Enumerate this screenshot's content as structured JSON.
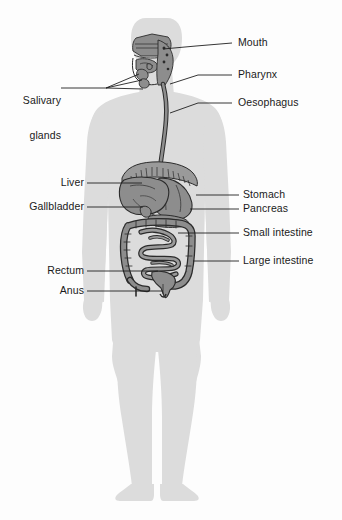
{
  "diagram": {
    "view": "anterior-whole-body",
    "background_color": "#fdfdfd",
    "body_silhouette_color": "#dcdcdc",
    "organ_fill_color": "#8d8d8d",
    "organ_outline_color": "#2b2b2b",
    "leader_line_color": "#1f1f1f",
    "text_color": "#1a1a1a"
  },
  "labels": [
    {
      "id": "mouth",
      "text": "Mouth",
      "side": "right",
      "x": 238,
      "y": 37,
      "leader": [
        [
          232,
          43
        ],
        [
          196,
          46
        ],
        [
          163,
          49
        ]
      ]
    },
    {
      "id": "pharynx",
      "text": "Pharynx",
      "side": "right",
      "x": 238,
      "y": 69,
      "leader": [
        [
          232,
          75
        ],
        [
          198,
          75
        ],
        [
          170,
          84
        ]
      ]
    },
    {
      "id": "oesophagus",
      "text": "Oesophagus",
      "side": "right",
      "x": 238,
      "y": 97,
      "leader": [
        [
          232,
          103
        ],
        [
          198,
          103
        ],
        [
          170,
          113
        ]
      ]
    },
    {
      "id": "salivary-glands",
      "text": "Salivary\nglands",
      "line1": "Salivary",
      "line2": "glands",
      "side": "left",
      "x": 31,
      "y": 72,
      "leader_fan": [
        [
          [
            106,
            88
          ],
          [
            139,
            74
          ]
        ],
        [
          [
            106,
            88
          ],
          [
            142,
            80
          ]
        ],
        [
          [
            106,
            88
          ],
          [
            143,
            89
          ]
        ]
      ],
      "leader_stem": [
        [
          61,
          88
        ],
        [
          106,
          88
        ]
      ]
    },
    {
      "id": "liver",
      "text": "Liver",
      "side": "left",
      "x": 53,
      "y": 177,
      "leader": [
        [
          87,
          183
        ],
        [
          142,
          183
        ]
      ]
    },
    {
      "id": "gallbladder",
      "text": "Gallbladder",
      "side": "left",
      "x": 10,
      "y": 201,
      "leader": [
        [
          87,
          207
        ],
        [
          143,
          207
        ]
      ]
    },
    {
      "id": "stomach",
      "text": "Stomach",
      "side": "right",
      "x": 243,
      "y": 189,
      "leader": [
        [
          239,
          195
        ],
        [
          196,
          195
        ]
      ]
    },
    {
      "id": "pancreas",
      "text": "Pancreas",
      "side": "right",
      "x": 243,
      "y": 203,
      "leader": [
        [
          239,
          209
        ],
        [
          190,
          209
        ]
      ]
    },
    {
      "id": "small-intestine",
      "text": "Small intestine",
      "side": "right",
      "x": 243,
      "y": 227,
      "leader": [
        [
          239,
          233
        ],
        [
          178,
          233
        ]
      ]
    },
    {
      "id": "large-intestine",
      "text": "Large intestine",
      "side": "right",
      "x": 243,
      "y": 255,
      "leader": [
        [
          239,
          261
        ],
        [
          193,
          261
        ]
      ]
    },
    {
      "id": "rectum",
      "text": "Rectum",
      "side": "left",
      "x": 37,
      "y": 265,
      "leader": [
        [
          87,
          271
        ],
        [
          158,
          271
        ]
      ]
    },
    {
      "id": "anus",
      "text": "Anus",
      "side": "left",
      "x": 52,
      "y": 285,
      "leader": [
        [
          87,
          291
        ],
        [
          163,
          291
        ]
      ]
    }
  ],
  "organs": [
    {
      "id": "nasal-cavity",
      "name": "Nasal cavity"
    },
    {
      "id": "tongue",
      "name": "Tongue"
    },
    {
      "id": "parotid-gland",
      "name": "Parotid salivary gland"
    },
    {
      "id": "submandibular-gland",
      "name": "Submandibular salivary gland"
    },
    {
      "id": "sublingual-gland",
      "name": "Sublingual salivary gland"
    },
    {
      "id": "pharynx",
      "name": "Pharynx"
    },
    {
      "id": "oesophagus",
      "name": "Oesophagus"
    },
    {
      "id": "diaphragm",
      "name": "Diaphragm"
    },
    {
      "id": "liver",
      "name": "Liver"
    },
    {
      "id": "gallbladder",
      "name": "Gallbladder"
    },
    {
      "id": "stomach",
      "name": "Stomach"
    },
    {
      "id": "pancreas",
      "name": "Pancreas"
    },
    {
      "id": "small-intestine",
      "name": "Small intestine"
    },
    {
      "id": "large-intestine",
      "name": "Large intestine"
    },
    {
      "id": "rectum",
      "name": "Rectum"
    },
    {
      "id": "anus",
      "name": "Anus"
    }
  ]
}
